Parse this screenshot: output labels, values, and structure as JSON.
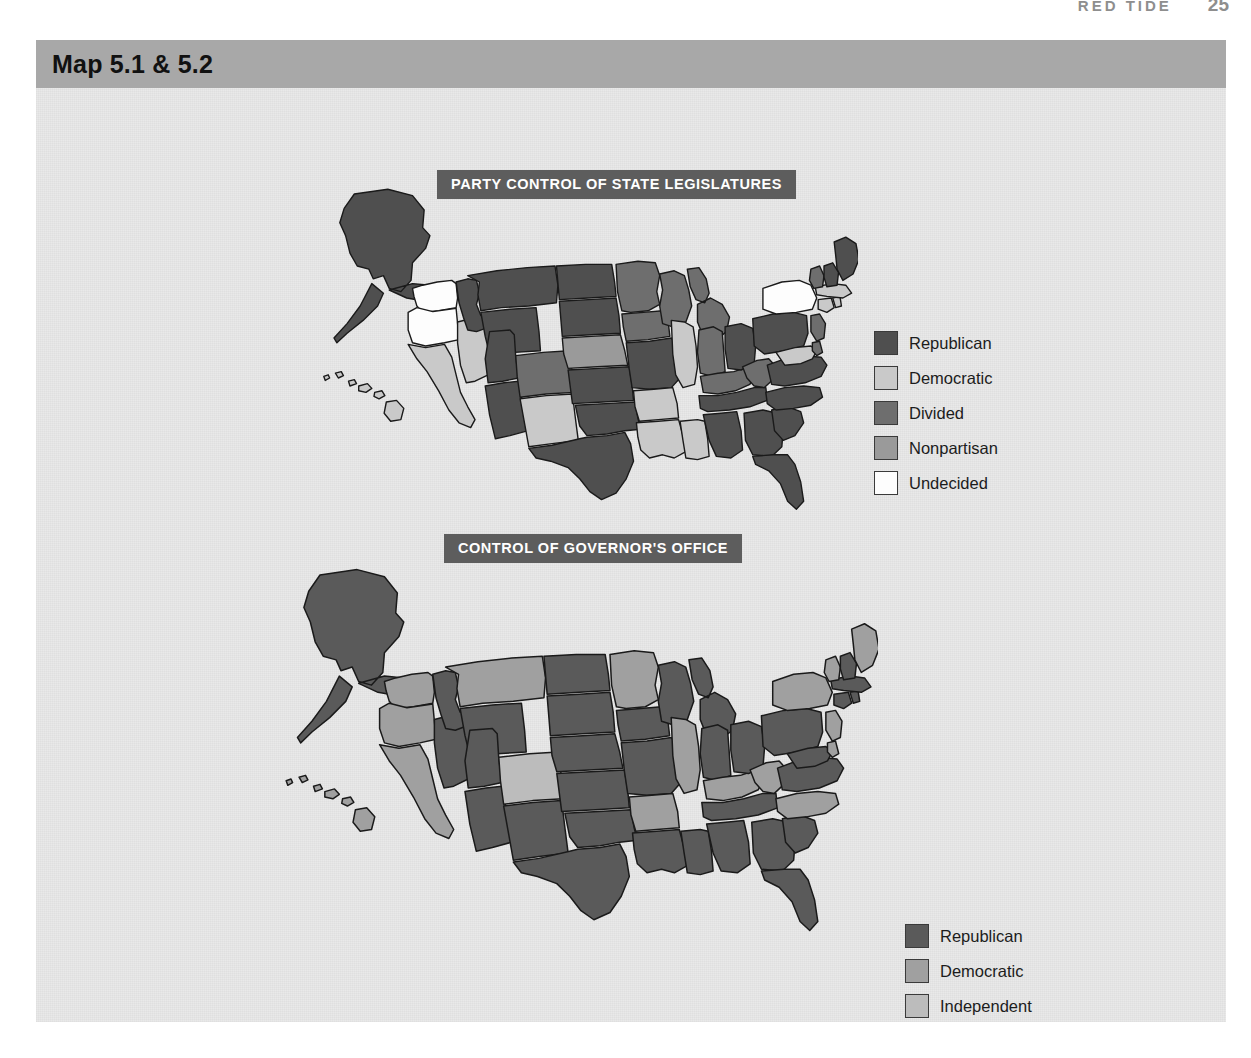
{
  "running_head": {
    "title": "RED TIDE",
    "page_number": "25"
  },
  "panel": {
    "header_title": "Map 5.1 & 5.2",
    "background_color": "#e9e9e9",
    "header_color": "#a8a8a8"
  },
  "palette": {
    "republican": "#4f4f4f",
    "democratic": "#c9c9c9",
    "divided": "#6e6e6e",
    "nonpartisan": "#9a9a9a",
    "undecided": "#fdfdfd",
    "independent": "#bcbcbc",
    "gov_republican": "#5a5a5a",
    "gov_democratic": "#a0a0a0",
    "outline": "#1a1a1a",
    "title_bar": "#5d5d5d",
    "title_text": "#ffffff"
  },
  "maps": [
    {
      "id": "map-5-1",
      "title": "PARTY CONTROL OF STATE LEGISLATURES",
      "legend": [
        {
          "label": "Republican",
          "color": "#4f4f4f"
        },
        {
          "label": "Democratic",
          "color": "#c9c9c9"
        },
        {
          "label": "Divided",
          "color": "#6e6e6e"
        },
        {
          "label": "Nonpartisan",
          "color": "#9a9a9a"
        },
        {
          "label": "Undecided",
          "color": "#fdfdfd"
        }
      ],
      "states": {
        "AK": "Republican",
        "HI": "Democratic",
        "WA": "Undecided",
        "OR": "Undecided",
        "CA": "Democratic",
        "NV": "Democratic",
        "ID": "Republican",
        "MT": "Republican",
        "WY": "Republican",
        "UT": "Republican",
        "AZ": "Republican",
        "CO": "Divided",
        "NM": "Democratic",
        "ND": "Republican",
        "SD": "Republican",
        "NE": "Nonpartisan",
        "KS": "Republican",
        "OK": "Republican",
        "TX": "Republican",
        "MN": "Divided",
        "IA": "Divided",
        "MO": "Republican",
        "AR": "Democratic",
        "LA": "Democratic",
        "WI": "Divided",
        "IL": "Democratic",
        "MS": "Democratic",
        "MI": "Divided",
        "IN": "Divided",
        "KY": "Divided",
        "TN": "Republican",
        "AL": "Republican",
        "OH": "Republican",
        "WV": "Divided",
        "GA": "Republican",
        "FL": "Republican",
        "SC": "Republican",
        "NC": "Republican",
        "VA": "Republican",
        "PA": "Republican",
        "NY": "Undecided",
        "MD": "Democratic",
        "DE": "Divided",
        "NJ": "Divided",
        "CT": "Democratic",
        "RI": "Democratic",
        "MA": "Democratic",
        "VT": "Divided",
        "NH": "Republican",
        "ME": "Republican"
      }
    },
    {
      "id": "map-5-2",
      "title": "CONTROL OF GOVERNOR'S OFFICE",
      "legend": [
        {
          "label": "Republican",
          "color": "#5a5a5a"
        },
        {
          "label": "Democratic",
          "color": "#a0a0a0"
        },
        {
          "label": "Independent",
          "color": "#bcbcbc"
        }
      ],
      "states": {
        "AK": "Republican",
        "HI": "Democratic",
        "WA": "Democratic",
        "OR": "Democratic",
        "CA": "Democratic",
        "NV": "Republican",
        "ID": "Republican",
        "MT": "Democratic",
        "WY": "Republican",
        "UT": "Republican",
        "AZ": "Republican",
        "CO": "Independent",
        "NM": "Republican",
        "ND": "Republican",
        "SD": "Republican",
        "NE": "Republican",
        "KS": "Republican",
        "OK": "Republican",
        "TX": "Republican",
        "MN": "Democratic",
        "IA": "Republican",
        "MO": "Republican",
        "AR": "Democratic",
        "LA": "Republican",
        "WI": "Republican",
        "IL": "Democratic",
        "MS": "Republican",
        "MI": "Republican",
        "IN": "Republican",
        "KY": "Democratic",
        "TN": "Republican",
        "AL": "Republican",
        "OH": "Republican",
        "WV": "Democratic",
        "GA": "Republican",
        "FL": "Republican",
        "SC": "Republican",
        "NC": "Democratic",
        "VA": "Republican",
        "PA": "Republican",
        "NY": "Democratic",
        "MD": "Republican",
        "DE": "Democratic",
        "NJ": "Democratic",
        "CT": "Republican",
        "RI": "Republican",
        "MA": "Republican",
        "VT": "Democratic",
        "NH": "Republican",
        "ME": "Democratic"
      }
    }
  ]
}
